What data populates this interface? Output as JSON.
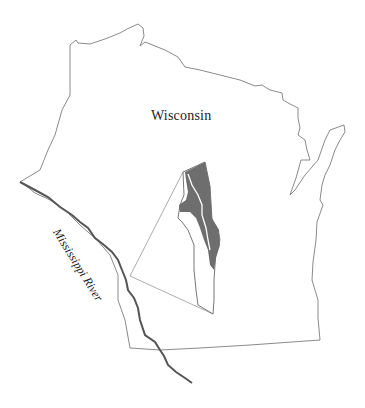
{
  "map": {
    "title": "Wisconsin",
    "labels": {
      "state": "Wisconsin",
      "river": "Mississippi River"
    },
    "inset": {
      "description": "study area (shaded region) with dashed lines linking to location on Mississippi River"
    },
    "colors": {
      "outline": "#8a8a8a",
      "river": "#555555",
      "study_area_fill": "#6e6e6e",
      "background": "#ffffff"
    },
    "caption": ""
  }
}
